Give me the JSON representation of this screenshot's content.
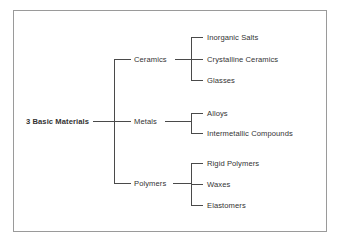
{
  "diagram": {
    "title_text": "3 Basic Materials",
    "frame_color": "#9a9a9a",
    "line_color": "#4a4a4a",
    "background_color": "#ffffff",
    "text_color": "#333333",
    "root": {
      "label": "3 Basic Materials"
    },
    "branches": [
      {
        "label": "Ceramics",
        "children": [
          {
            "label": "Inorganic Salts"
          },
          {
            "label": "Crystalline Ceramics"
          },
          {
            "label": "Glasses"
          }
        ]
      },
      {
        "label": "Metals",
        "children": [
          {
            "label": "Alloys"
          },
          {
            "label": "Intermetallic Compounds"
          }
        ]
      },
      {
        "label": "Polymers",
        "children": [
          {
            "label": "Rigid Polymers"
          },
          {
            "label": "Waxes"
          },
          {
            "label": "Elastomers"
          }
        ]
      }
    ]
  }
}
